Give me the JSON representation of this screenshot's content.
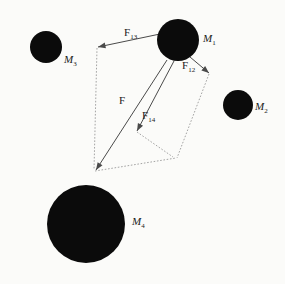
{
  "figure": {
    "background_color": "#fbfbf9",
    "body_color": "#0b0b0b",
    "vector_color": "#4a4a4a",
    "construction_color": "#9a9a9a"
  },
  "masses": [
    {
      "id": "M1",
      "label": "M",
      "subscript": "1",
      "cx": 178,
      "cy": 40,
      "r": 21,
      "label_x": 203,
      "label_y": 33
    },
    {
      "id": "M2",
      "label": "M",
      "subscript": "2",
      "cx": 238,
      "cy": 105,
      "r": 15,
      "label_x": 255,
      "label_y": 101
    },
    {
      "id": "M3",
      "label": "M",
      "subscript": "3",
      "cx": 46,
      "cy": 47,
      "r": 16,
      "label_x": 64,
      "label_y": 54
    },
    {
      "id": "M4",
      "label": "M",
      "subscript": "4",
      "cx": 86,
      "cy": 224,
      "r": 39,
      "label_x": 132,
      "label_y": 216
    }
  ],
  "vectors": [
    {
      "id": "F13",
      "label": "F",
      "subscript": "13",
      "x1": 160,
      "y1": 34,
      "x2": 98,
      "y2": 47,
      "label_x": 124,
      "label_y": 27
    },
    {
      "id": "F12",
      "label": "F",
      "subscript": "12",
      "x1": 190,
      "y1": 57,
      "x2": 209,
      "y2": 73,
      "label_x": 182,
      "label_y": 60
    },
    {
      "id": "F14",
      "label": "F",
      "subscript": "14",
      "x1": 174,
      "y1": 61,
      "x2": 137,
      "y2": 131,
      "label_x": 142,
      "label_y": 110
    },
    {
      "id": "F",
      "label": "F",
      "subscript": "",
      "x1": 167,
      "y1": 60,
      "x2": 96,
      "y2": 170,
      "label_x": 119,
      "label_y": 95
    }
  ],
  "construction_lines": [
    {
      "id": "left-side",
      "x1": 97,
      "y1": 48,
      "x2": 94,
      "y2": 170
    },
    {
      "id": "bottom-side",
      "x1": 95,
      "y1": 171,
      "x2": 176,
      "y2": 158
    },
    {
      "id": "right-side",
      "x1": 209,
      "y1": 74,
      "x2": 177,
      "y2": 158
    },
    {
      "id": "inner-left",
      "x1": 137,
      "y1": 132,
      "x2": 173,
      "y2": 157
    }
  ]
}
